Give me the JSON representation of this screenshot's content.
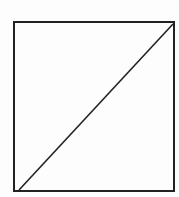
{
  "diagram": {
    "stroke_color": "#222222",
    "background_color": "#fdfdfd",
    "square": {
      "x": 14,
      "y": 22,
      "width": 160,
      "height": 169,
      "stroke_width": 2
    },
    "diagonal": {
      "x1": 19,
      "y1": 190,
      "x2": 173,
      "y2": 24,
      "stroke_width": 1.6
    }
  }
}
